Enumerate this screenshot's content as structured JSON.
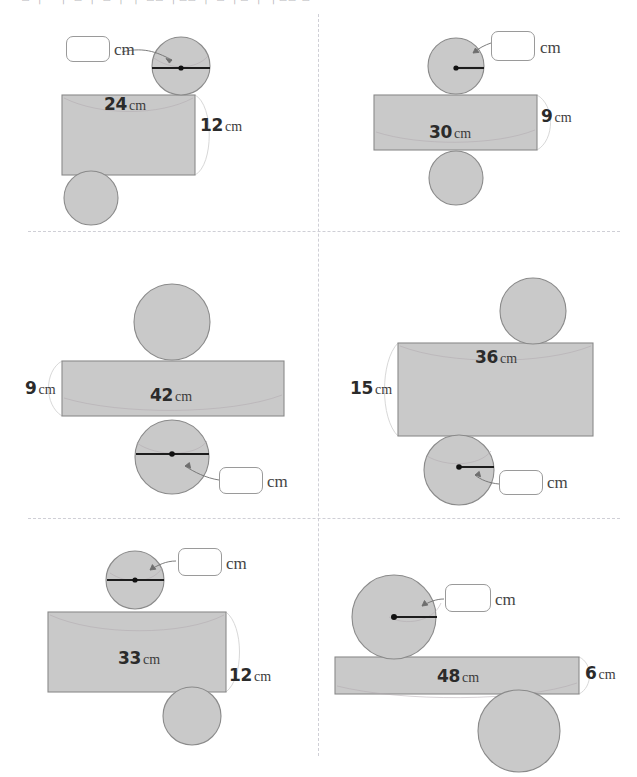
{
  "page": {
    "header_fragment": "— □ │○ │ □ │ □ │ │ □□ │□□ │ □ │□ │ │□□ □",
    "shape_fill": "#c9c9c9",
    "shape_stroke": "#8a8a8a",
    "divider_color": "#cfcfd6",
    "box_border": "#9a9a9a"
  },
  "unit": "cm",
  "panels": [
    {
      "id": "panel-1",
      "circumference": "24",
      "circumference_unit": "cm",
      "height": "12",
      "height_unit": "cm",
      "answer_unit": "cm",
      "answer_value": "",
      "marked_measure": "radius",
      "marker_circle": "top",
      "answer_box_position": "left-of-top-circle"
    },
    {
      "id": "panel-2",
      "circumference": "30",
      "circumference_unit": "cm",
      "height": "9",
      "height_unit": "cm",
      "answer_unit": "cm",
      "answer_value": "",
      "marked_measure": "radius",
      "marker_circle": "top",
      "answer_box_position": "right-of-top-circle"
    },
    {
      "id": "panel-3",
      "circumference": "42",
      "circumference_unit": "cm",
      "height": "9",
      "height_unit": "cm",
      "answer_unit": "cm",
      "answer_value": "",
      "marked_measure": "diameter",
      "marker_circle": "bottom",
      "answer_box_position": "right-of-bottom-circle"
    },
    {
      "id": "panel-4",
      "circumference": "36",
      "circumference_unit": "cm",
      "height": "15",
      "height_unit": "cm",
      "answer_unit": "cm",
      "answer_value": "",
      "marked_measure": "radius",
      "marker_circle": "bottom",
      "answer_box_position": "right-of-bottom-circle"
    },
    {
      "id": "panel-5",
      "circumference": "33",
      "circumference_unit": "cm",
      "height": "12",
      "height_unit": "cm",
      "answer_unit": "cm",
      "answer_value": "",
      "marked_measure": "diameter",
      "marker_circle": "top",
      "answer_box_position": "right-of-top-circle"
    },
    {
      "id": "panel-6",
      "circumference": "48",
      "circumference_unit": "cm",
      "height": "6",
      "height_unit": "cm",
      "answer_unit": "cm",
      "answer_value": "",
      "marked_measure": "radius",
      "marker_circle": "top",
      "answer_box_position": "right-of-top-circle"
    }
  ]
}
